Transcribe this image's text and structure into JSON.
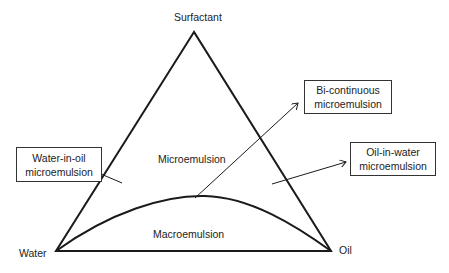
{
  "diagram": {
    "type": "ternary-phase-diagram",
    "vertices": {
      "top": "Surfactant",
      "bottom_left": "Water",
      "bottom_right": "Oil"
    },
    "regions": {
      "upper": "Microemulsion",
      "lower": "Macroemulsion"
    },
    "callouts": [
      {
        "line1": "Water-in-oil",
        "line2": "microemulsion"
      },
      {
        "line1": "Bi-continuous",
        "line2": "microemulsion"
      },
      {
        "line1": "Oil-in-water",
        "line2": "microemulsion"
      }
    ],
    "colors": {
      "line": "#1a1a1a",
      "background": "#ffffff"
    }
  }
}
